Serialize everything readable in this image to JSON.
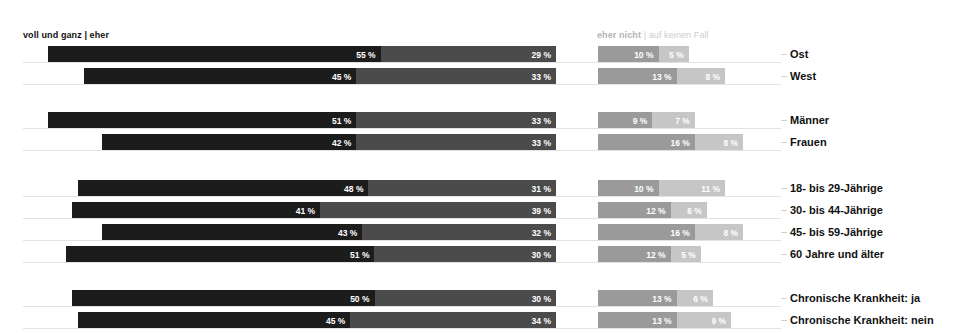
{
  "header": {
    "left_label": "voll und ganz | eher",
    "right_label_strong": "eher nicht",
    "right_label_sep": "|",
    "right_label_soft": "auf keinen Fall"
  },
  "legend_keys": [
    "voll und ganz",
    "eher",
    "eher nicht",
    "auf keinen Fall"
  ],
  "chart_data": {
    "type": "bar",
    "title": "",
    "subtitle": "",
    "xlabel": "",
    "ylabel": "",
    "orientation": "horizontal",
    "stacked": true,
    "diverging": true,
    "grid": false,
    "legend_position": "top",
    "unit": "%",
    "xlim": [
      0,
      100
    ],
    "series": [
      {
        "name": "voll und ganz",
        "color": "#1c1c1c",
        "values": [
          55,
          45,
          51,
          42,
          48,
          41,
          43,
          51,
          50,
          45
        ]
      },
      {
        "name": "eher",
        "color": "#4b4b4b",
        "values": [
          29,
          33,
          33,
          33,
          31,
          39,
          32,
          30,
          30,
          34
        ]
      },
      {
        "name": "eher nicht",
        "color": "#9a9a9a",
        "values": [
          10,
          13,
          9,
          16,
          10,
          12,
          16,
          12,
          13,
          13
        ]
      },
      {
        "name": "auf keinen Fall",
        "color": "#c6c6c6",
        "values": [
          5,
          8,
          7,
          8,
          11,
          6,
          8,
          5,
          6,
          9
        ]
      }
    ],
    "categories": [
      "Ost",
      "West",
      "Männer",
      "Frauen",
      "18- bis 29-Jährige",
      "30- bis 44-Jährige",
      "45- bis 59-Jährige",
      "60 Jahre und älter",
      "Chronische Krankheit: ja",
      "Chronische Krankheit: nein"
    ],
    "groups": [
      {
        "name": "Region",
        "categories": [
          "Ost",
          "West"
        ]
      },
      {
        "name": "Geschlecht",
        "categories": [
          "Männer",
          "Frauen"
        ]
      },
      {
        "name": "Alter",
        "categories": [
          "18- bis 29-Jährige",
          "30- bis 44-Jährige",
          "45- bis 59-Jährige",
          "60 Jahre und älter"
        ]
      },
      {
        "name": "Chronische Krankheit",
        "categories": [
          "Chronische Krankheit: ja",
          "Chronische Krankheit: nein"
        ]
      }
    ]
  },
  "rows": [
    {
      "label": "Ost",
      "top": 46,
      "v1": 55,
      "v2": 29,
      "v3": 10,
      "v4": 5,
      "t1": "55 %",
      "t2": "29 %",
      "t3": "10 %",
      "t4": "5 %"
    },
    {
      "label": "West",
      "top": 68,
      "v1": 45,
      "v2": 33,
      "v3": 13,
      "v4": 8,
      "t1": "45 %",
      "t2": "33 %",
      "t3": "13 %",
      "t4": "8 %"
    },
    {
      "label": "Männer",
      "top": 112,
      "v1": 51,
      "v2": 33,
      "v3": 9,
      "v4": 7,
      "t1": "51 %",
      "t2": "33 %",
      "t3": "9 %",
      "t4": "7 %"
    },
    {
      "label": "Frauen",
      "top": 134,
      "v1": 42,
      "v2": 33,
      "v3": 16,
      "v4": 8,
      "t1": "42 %",
      "t2": "33 %",
      "t3": "16 %",
      "t4": "8 %"
    },
    {
      "label": "18- bis 29-Jährige",
      "top": 180,
      "v1": 48,
      "v2": 31,
      "v3": 10,
      "v4": 11,
      "t1": "48 %",
      "t2": "31 %",
      "t3": "10 %",
      "t4": "11 %"
    },
    {
      "label": "30- bis 44-Jährige",
      "top": 202,
      "v1": 41,
      "v2": 39,
      "v3": 12,
      "v4": 6,
      "t1": "41 %",
      "t2": "39 %",
      "t3": "12 %",
      "t4": "6 %"
    },
    {
      "label": "45- bis 59-Jährige",
      "top": 224,
      "v1": 43,
      "v2": 32,
      "v3": 16,
      "v4": 8,
      "t1": "43 %",
      "t2": "32 %",
      "t3": "16 %",
      "t4": "8 %"
    },
    {
      "label": "60 Jahre und älter",
      "top": 246,
      "v1": 51,
      "v2": 30,
      "v3": 12,
      "v4": 5,
      "t1": "51 %",
      "t2": "30 %",
      "t3": "12 %",
      "t4": "5 %"
    },
    {
      "label": "Chronische Krankheit: ja",
      "top": 290,
      "v1": 50,
      "v2": 30,
      "v3": 13,
      "v4": 6,
      "t1": "50 %",
      "t2": "30 %",
      "t3": "13 %",
      "t4": "6 %"
    },
    {
      "label": "Chronische Krankheit: nein",
      "top": 312,
      "v1": 45,
      "v2": 34,
      "v3": 13,
      "v4": 9,
      "t1": "45 %",
      "t2": "34 %",
      "t3": "13 %",
      "t4": "9 %"
    }
  ],
  "geometry": {
    "left_axis_end_x": 556,
    "right_axis_start_x": 598,
    "px_per_percent": 6.05,
    "label_x": 790
  }
}
